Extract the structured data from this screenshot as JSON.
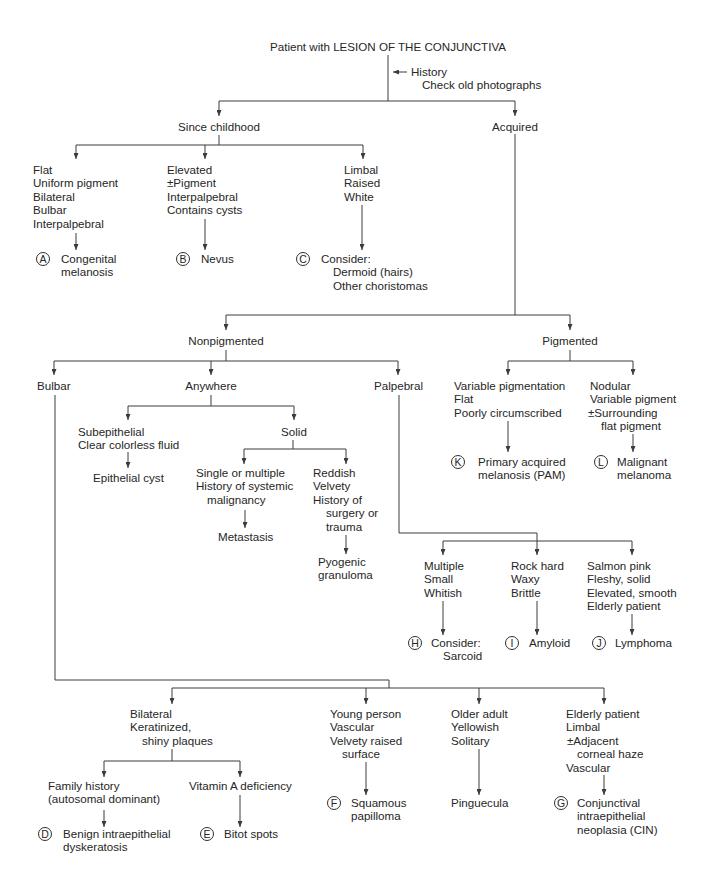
{
  "colors": {
    "text": "#262626",
    "line": "#3c3c3c",
    "background": "#ffffff"
  },
  "root": {
    "label": "Patient with LESION OF THE CONJUNCTIVA",
    "note": [
      "History",
      "Check old photographs"
    ]
  },
  "tree": {
    "since_childhood": {
      "label": "Since childhood",
      "children": [
        {
          "criteria": [
            "Flat",
            "Uniform pigment",
            "Bilateral",
            "Bulbar",
            "Interpalpebral"
          ],
          "marker": "A",
          "diagnosis": [
            "Congenital",
            "melanosis"
          ]
        },
        {
          "criteria": [
            "Elevated",
            "±Pigment",
            "Interpalpebral",
            "Contains cysts"
          ],
          "marker": "B",
          "diagnosis": [
            "Nevus"
          ]
        },
        {
          "criteria": [
            "Limbal",
            "Raised",
            "White"
          ],
          "marker": "C",
          "diagnosis": [
            "Consider:",
            "Dermoid (hairs)",
            "Other choristomas"
          ]
        }
      ]
    },
    "acquired": {
      "label": "Acquired",
      "nonpigmented": {
        "label": "Nonpigmented",
        "bulbar": {
          "label": "Bulbar",
          "children": [
            {
              "criteria": [
                "Bilateral",
                "Keratinized,",
                "shiny plaques"
              ],
              "children": [
                {
                  "criteria": [
                    "Family history",
                    "(autosomal dominant)"
                  ],
                  "marker": "D",
                  "diagnosis": [
                    "Benign intraepithelial",
                    "dyskeratosis"
                  ]
                },
                {
                  "criteria": [
                    "Vitamin A deficiency"
                  ],
                  "marker": "E",
                  "diagnosis": [
                    "Bitot spots"
                  ]
                }
              ]
            },
            {
              "criteria": [
                "Young person",
                "Vascular",
                "Velvety raised",
                "surface"
              ],
              "marker": "F",
              "diagnosis": [
                "Squamous",
                "papilloma"
              ]
            },
            {
              "criteria": [
                "Older adult",
                "Yellowish",
                "Solitary"
              ],
              "diagnosis": [
                "Pinguecula"
              ]
            },
            {
              "criteria": [
                "Elderly patient",
                "Limbal",
                "±Adjacent",
                "corneal haze",
                "Vascular"
              ],
              "marker": "G",
              "diagnosis": [
                "Conjunctival",
                "intraepithelial",
                "neoplasia (CIN)"
              ]
            }
          ]
        },
        "anywhere": {
          "label": "Anywhere",
          "subepithelial": {
            "criteria": [
              "Subepithelial",
              "Clear colorless fluid"
            ],
            "diagnosis": [
              "Epithelial cyst"
            ]
          },
          "solid": {
            "label": "Solid",
            "children": [
              {
                "criteria": [
                  "Single or multiple",
                  "History of systemic",
                  "malignancy"
                ],
                "diagnosis": [
                  "Metastasis"
                ]
              },
              {
                "criteria": [
                  "Reddish",
                  "Velvety",
                  "History of",
                  "surgery or",
                  "trauma"
                ],
                "diagnosis": [
                  "Pyogenic",
                  "granuloma"
                ]
              }
            ]
          }
        },
        "palpebral": {
          "label": "Palpebral",
          "children": [
            {
              "criteria": [
                "Multiple",
                "Small",
                "Whitish"
              ],
              "marker": "H",
              "diagnosis": [
                "Consider:",
                "Sarcoid"
              ]
            },
            {
              "criteria": [
                "Rock hard",
                "Waxy",
                "Brittle"
              ],
              "marker": "I",
              "diagnosis": [
                "Amyloid"
              ]
            },
            {
              "criteria": [
                "Salmon pink",
                "Fleshy, solid",
                "Elevated, smooth",
                "Elderly patient"
              ],
              "marker": "J",
              "diagnosis": [
                "Lymphoma"
              ]
            }
          ]
        }
      },
      "pigmented": {
        "label": "Pigmented",
        "children": [
          {
            "criteria": [
              "Variable pigmentation",
              "Flat",
              "Poorly circumscribed"
            ],
            "marker": "K",
            "diagnosis": [
              "Primary acquired",
              "melanosis (PAM)"
            ]
          },
          {
            "criteria": [
              "Nodular",
              "Variable pigment",
              "±Surrounding",
              "flat pigment"
            ],
            "marker": "L",
            "diagnosis": [
              "Malignant",
              "melanoma"
            ]
          }
        ]
      }
    }
  }
}
